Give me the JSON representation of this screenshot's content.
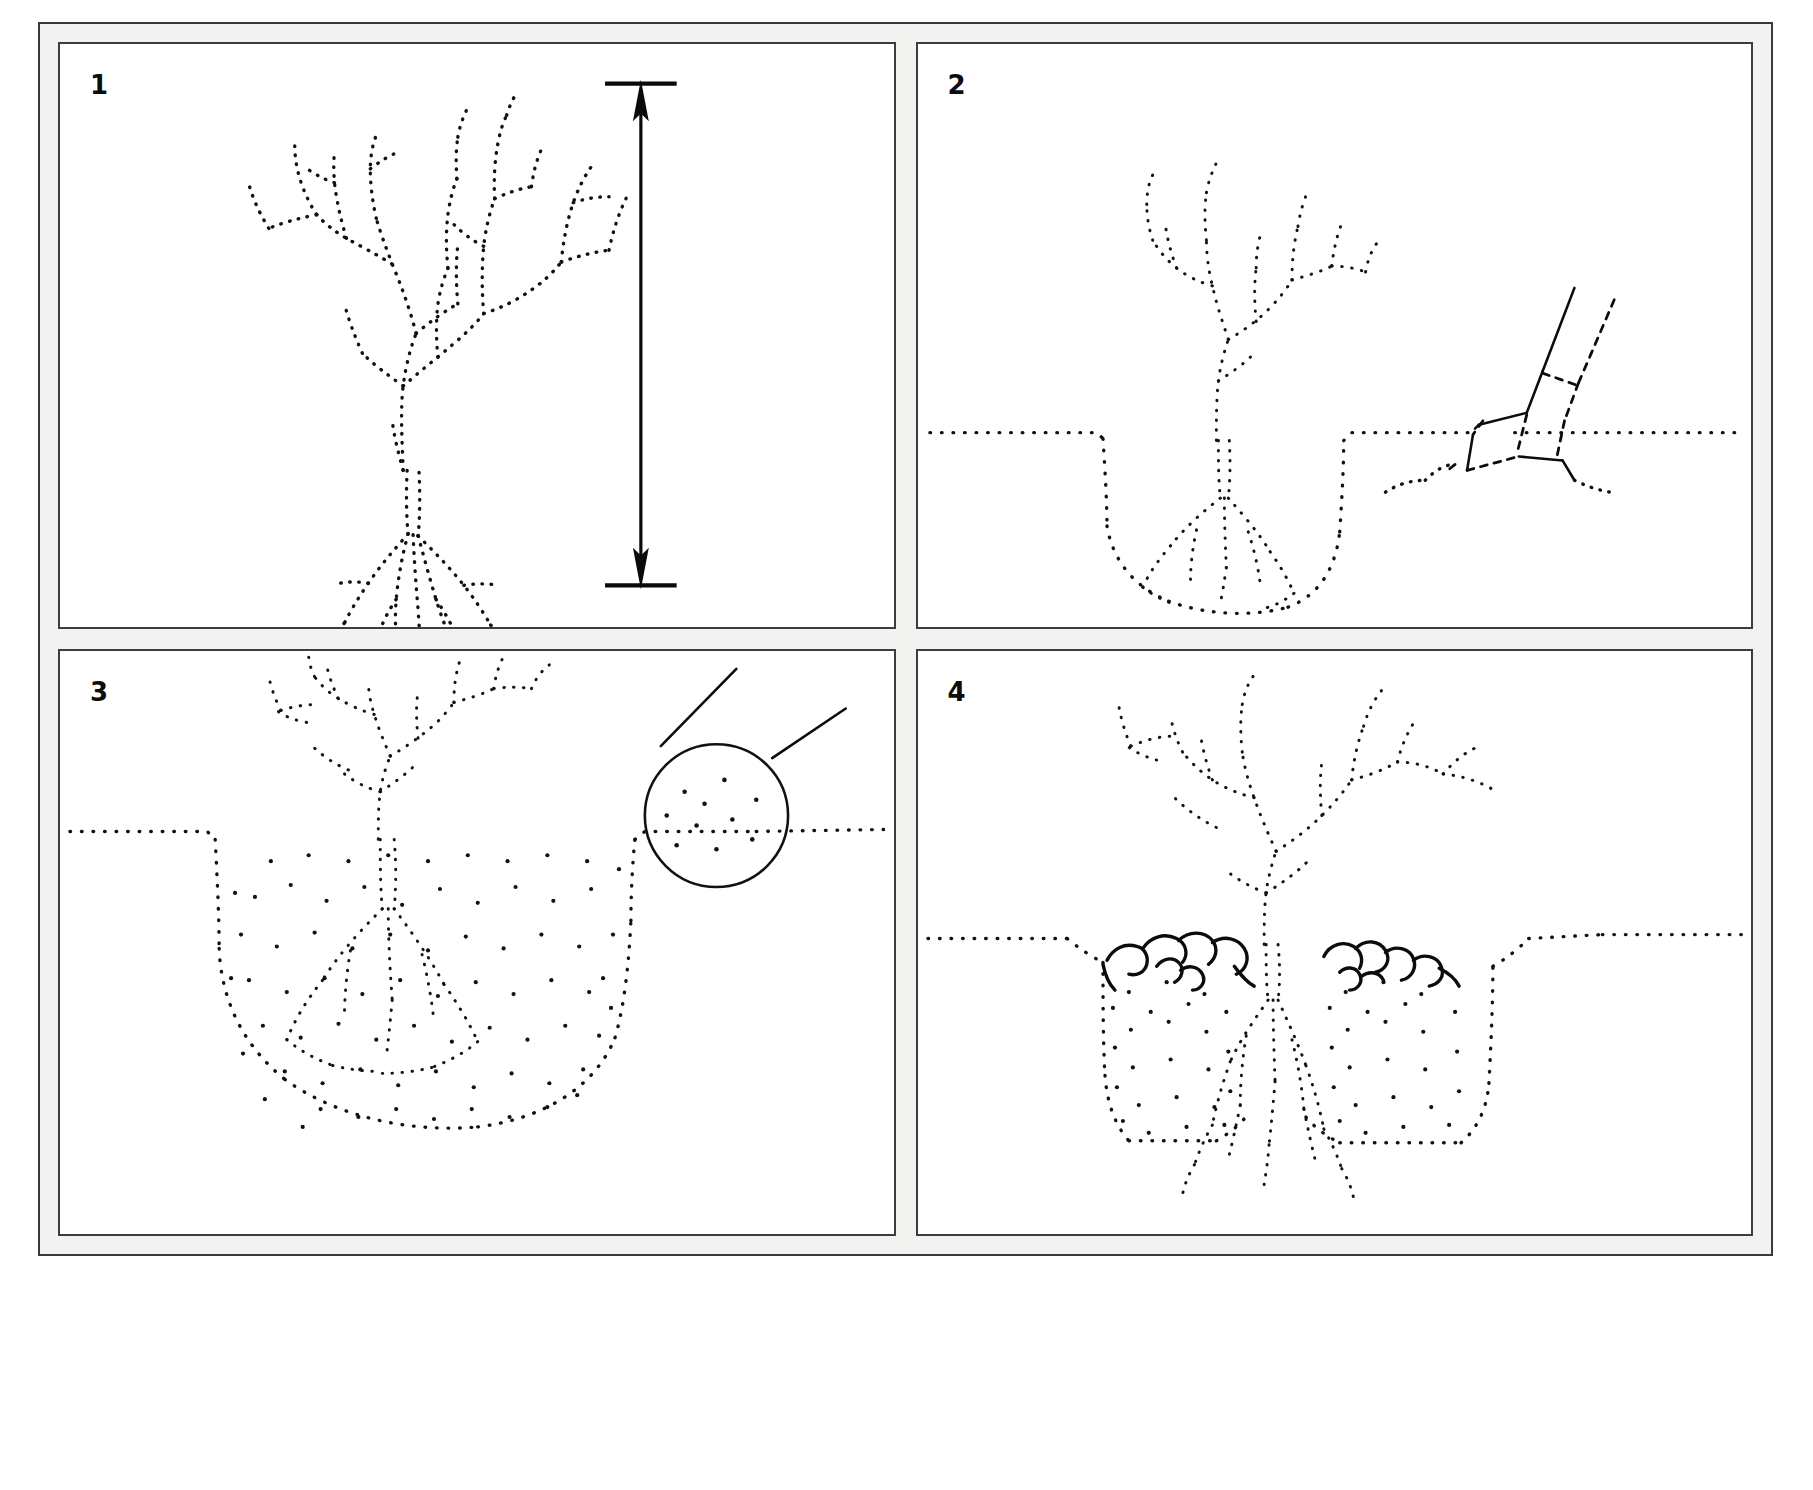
{
  "figure": {
    "style": "stipple line drawing, black on white",
    "background_color": "#ffffff",
    "plate_color": "#f2f2f0",
    "ink_color": "#111111",
    "panel_count": 4,
    "layout": "2 columns x 2 rows"
  },
  "panels": [
    {
      "number": "1",
      "name": "bare-root-plant-with-height-measure",
      "caption_text": "",
      "elements": [
        "bare-root shrub with branched top growth",
        "fibrous root system below",
        "double-headed vertical measuring arrow at right"
      ],
      "annotation": {
        "type": "dimension-arrow",
        "orientation": "vertical",
        "label": ""
      }
    },
    {
      "number": "2",
      "name": "digging-the-planting-hole",
      "caption_text": "",
      "elements": [
        "shrub set into excavated hole",
        "ground line at soil surface",
        "spade blade and handle cutting soil at right"
      ],
      "tool": "spade"
    },
    {
      "number": "3",
      "name": "backfilled-hole-with-soil-detail",
      "caption_text": "",
      "elements": [
        "shrub planted in backfilled hole",
        "stippled soil fill in rounded hole",
        "magnifier circle showing soil particle detail",
        "two leader lines from magnifier to soil"
      ],
      "callout": {
        "type": "magnifier-detail-circle",
        "label": ""
      }
    },
    {
      "number": "4",
      "name": "mulch-layer-applied",
      "caption_text": "",
      "elements": [
        "established shrub with spreading branches",
        "flat-bottomed backfilled planting pit",
        "chunky mulch layer spread over soil surface",
        "ground line either side of the pit"
      ]
    }
  ]
}
